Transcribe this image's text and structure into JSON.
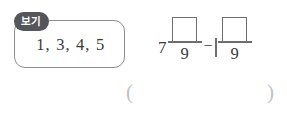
{
  "worksheet": {
    "choices_panel": {
      "tag_label": "보기",
      "items": [
        "1",
        "3",
        "4",
        "5"
      ],
      "separator": ","
    },
    "expression": {
      "whole_number": "7",
      "first_fraction": {
        "numerator_placeholder": "",
        "denominator": "9"
      },
      "operator": "−",
      "second_term": {
        "whole_placeholder": "",
        "numerator_placeholder": "",
        "denominator": "9"
      }
    },
    "answer_field": {
      "open_paren": "(",
      "close_paren": ")",
      "value": ""
    },
    "colors": {
      "tag_background": "#55565a",
      "tag_text": "#ffffff",
      "panel_border": "#8d8d8d",
      "box_border": "#6e6e6e",
      "text": "#3a3a3a",
      "paren": "#c2c2c2",
      "page_background": "#ffffff"
    }
  }
}
